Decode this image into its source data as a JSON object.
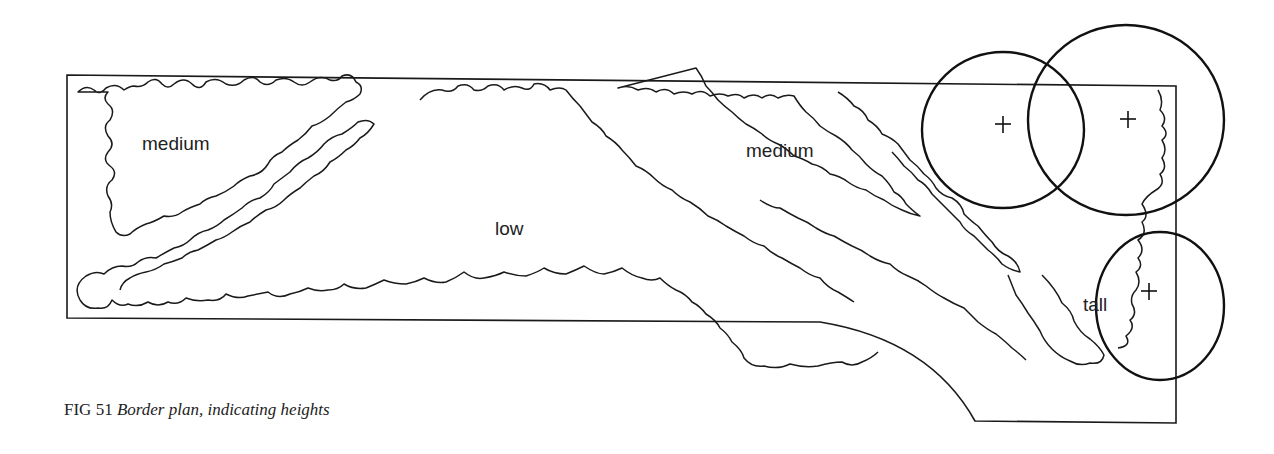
{
  "figure": {
    "number_label": "FIG 51",
    "title": "Border plan, indicating heights"
  },
  "zones": [
    {
      "label": "medium",
      "position": "top-left"
    },
    {
      "label": "low",
      "position": "center"
    },
    {
      "label": "medium",
      "position": "top-center-right"
    },
    {
      "label": "tall",
      "position": "right"
    }
  ],
  "trees": [
    {
      "marker": "+",
      "position": "top-right-1"
    },
    {
      "marker": "+",
      "position": "top-right-2"
    },
    {
      "marker": "+",
      "position": "bottom-right"
    }
  ]
}
